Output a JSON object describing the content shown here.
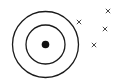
{
  "diagram": {
    "background": "#ffffff",
    "stroke_color": "#1a1a1a",
    "center": {
      "x": 45.5,
      "y": 44.5
    },
    "outer_ring_radius": 33,
    "inner_ring_radius": 19.5,
    "dot_radius": 3.8,
    "crosses": [
      {
        "x": 79,
        "y": 22
      },
      {
        "x": 108,
        "y": 11
      },
      {
        "x": 105,
        "y": 29
      },
      {
        "x": 94,
        "y": 45
      }
    ],
    "cross_symbol": "x-mark"
  }
}
